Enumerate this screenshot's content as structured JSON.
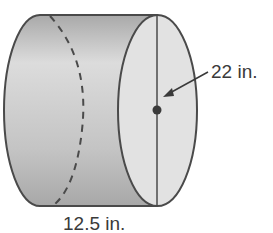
{
  "figure": {
    "shape": "cylinder",
    "orientation": "horizontal",
    "labels": {
      "diameter": "22 in.",
      "height": "12.5 in."
    },
    "colors": {
      "outline": "#4a4a4a",
      "body_fill": "#bdbdbd",
      "face_fill": "#e2e2e2",
      "text": "#3a3a3a"
    }
  }
}
